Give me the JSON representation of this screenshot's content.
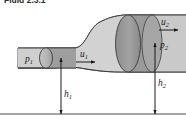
{
  "figure": {
    "caption_clipped": "Fluid 2.3.1",
    "labels": {
      "p1": {
        "base": "p",
        "sub": "1"
      },
      "p2": {
        "base": "p",
        "sub": "2"
      },
      "u1": {
        "base": "u",
        "sub": "1"
      },
      "u2": {
        "base": "u",
        "sub": "2"
      },
      "h1": {
        "base": "h",
        "sub": "1"
      },
      "h2": {
        "base": "h",
        "sub": "2"
      }
    },
    "colors": {
      "background": "#ffffff",
      "pipe_fill_light": "#d8d8d8",
      "pipe_fill_mid": "#c4c4c4",
      "disk_fill_dark": "#9a9a9a",
      "disk_fill_light": "#b8b8b8",
      "outline": "#3a3a3a",
      "ground_line": "#4a4a4a",
      "arrow": "#1a1a1a",
      "text": "#1a1a1a"
    },
    "elements": {
      "inlet_pipe": "narrow-pipe-section",
      "outlet_pipe": "wide-pipe-section",
      "transition": "expansion-transition",
      "inlet_disk": "inlet-cross-section-disk",
      "outlet_disk": "outlet-cross-section-disk",
      "ground": "datum-ground-line"
    }
  }
}
